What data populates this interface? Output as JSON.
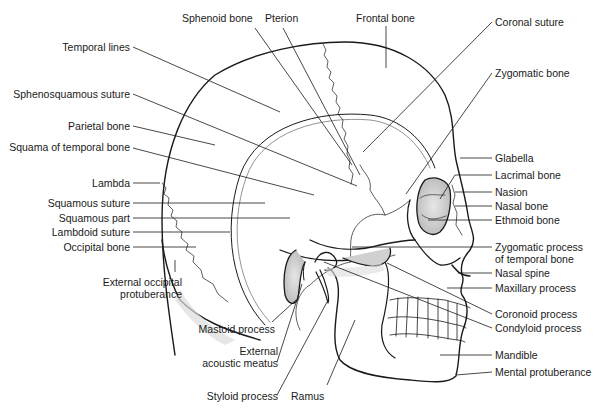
{
  "figure": {
    "colors": {
      "line": "#1a1a1a",
      "shade": "#c8c8c8",
      "background": "#ffffff"
    }
  },
  "labels": {
    "top": [
      {
        "id": "sphenoid-bone",
        "text": "Sphenoid bone"
      },
      {
        "id": "pterion",
        "text": "Pterion"
      },
      {
        "id": "frontal-bone",
        "text": "Frontal bone"
      }
    ],
    "left": [
      {
        "id": "temporal-lines",
        "text": "Temporal lines"
      },
      {
        "id": "sphenosquamous-suture",
        "text": "Sphenosquamous suture"
      },
      {
        "id": "parietal-bone",
        "text": "Parietal bone"
      },
      {
        "id": "squama-of-temporal-bone",
        "text": "Squama of temporal bone"
      },
      {
        "id": "lambda",
        "text": "Lambda"
      },
      {
        "id": "squamous-suture",
        "text": "Squamous suture"
      },
      {
        "id": "squamous-part",
        "text": "Squamous part"
      },
      {
        "id": "lambdoid-suture",
        "text": "Lambdoid suture"
      },
      {
        "id": "occipital-bone",
        "text": "Occipital bone"
      },
      {
        "id": "external-occipital-protuberance",
        "text": "External occipital",
        "text2": "protuberance"
      }
    ],
    "right": [
      {
        "id": "coronal-suture",
        "text": "Coronal suture"
      },
      {
        "id": "zygomatic-bone",
        "text": "Zygomatic bone"
      },
      {
        "id": "glabella",
        "text": "Glabella"
      },
      {
        "id": "lacrimal-bone",
        "text": "Lacrimal bone"
      },
      {
        "id": "nasion",
        "text": "Nasion"
      },
      {
        "id": "nasal-bone",
        "text": "Nasal bone"
      },
      {
        "id": "ethmoid-bone",
        "text": "Ethmoid bone"
      },
      {
        "id": "zygomatic-process",
        "text": "Zygomatic process",
        "text2": "of temporal bone"
      },
      {
        "id": "nasal-spine",
        "text": "Nasal spine"
      },
      {
        "id": "maxillary-process",
        "text": "Maxillary process"
      },
      {
        "id": "coronoid-process",
        "text": "Coronoid process"
      },
      {
        "id": "condyloid-process",
        "text": "Condyloid process"
      },
      {
        "id": "mandible",
        "text": "Mandible"
      },
      {
        "id": "mental-protuberance",
        "text": "Mental protuberance"
      }
    ],
    "bottom": [
      {
        "id": "mastoid-process",
        "text": "Mastoid process"
      },
      {
        "id": "external-acoustic-meatus",
        "text": "External",
        "text2": "acoustic meatus"
      },
      {
        "id": "styloid-process",
        "text": "Styloid process"
      },
      {
        "id": "ramus",
        "text": "Ramus"
      }
    ]
  }
}
